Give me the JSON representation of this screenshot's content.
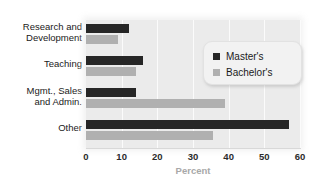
{
  "chart_data": {
    "type": "bar",
    "orientation": "horizontal",
    "title": "",
    "xlabel": "Percent",
    "ylabel": "",
    "xlim": [
      0,
      60
    ],
    "xticks": [
      0,
      10,
      20,
      30,
      40,
      50,
      60
    ],
    "grid": true,
    "legend_position": "top-right",
    "categories": [
      "Research and Development",
      "Teaching",
      "Mgmt., Sales and Admin.",
      "Other"
    ],
    "category_label_lines": [
      [
        "Research and",
        "Development"
      ],
      [
        "Teaching"
      ],
      [
        "Mgmt., Sales",
        "and Admin."
      ],
      [
        "Other"
      ]
    ],
    "series": [
      {
        "name": "Master's",
        "color": "#262626",
        "values": [
          12,
          16,
          14,
          57
        ]
      },
      {
        "name": "Bachelor's",
        "color": "#b0b0b0",
        "values": [
          9,
          14,
          39,
          35.5
        ]
      }
    ]
  },
  "legend": {
    "entries": [
      {
        "label": "Master's",
        "color": "#262626"
      },
      {
        "label": "Bachelor's",
        "color": "#b0b0b0"
      }
    ]
  },
  "axis": {
    "title": "Percent",
    "tick_labels": [
      "0",
      "10",
      "20",
      "30",
      "40",
      "50",
      "60"
    ]
  },
  "colors": {
    "plot_background": "#ebebeb",
    "gridline": "#fbfbfb",
    "master_bar": "#262626",
    "bachelor_bar": "#b0b0b0",
    "axis_title": "#a8a8a8",
    "tick_label": "#2b2b2b",
    "category_label": "#1a1a1a"
  }
}
